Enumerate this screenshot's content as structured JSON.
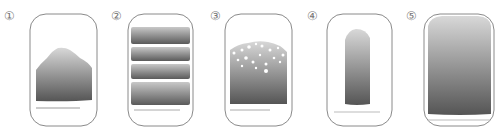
{
  "panels": [
    {
      "label": "①",
      "shape": "mound"
    },
    {
      "label": "②",
      "shape": "layers"
    },
    {
      "label": "③",
      "shape": "bubbles"
    },
    {
      "label": "④",
      "shape": "column"
    },
    {
      "label": "⑤",
      "shape": "full"
    }
  ],
  "colors": {
    "outline": "#8a8a8a",
    "fill_top": "#d4d4d4",
    "fill_bottom": "#555555"
  }
}
